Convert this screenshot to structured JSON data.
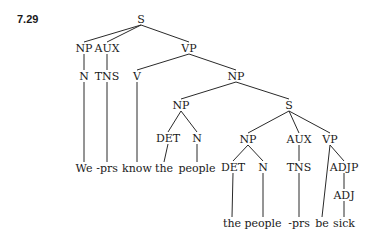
{
  "example_number": "7.29",
  "line_color": "#2a2a2a",
  "nodes": [
    {
      "id": "s0",
      "label": "S",
      "x": 141,
      "y": 19
    },
    {
      "id": "np0",
      "label": "NP",
      "x": 84,
      "y": 48
    },
    {
      "id": "aux0",
      "label": "AUX",
      "x": 107,
      "y": 48
    },
    {
      "id": "vp0",
      "label": "VP",
      "x": 189,
      "y": 48
    },
    {
      "id": "n0",
      "label": "N",
      "x": 84,
      "y": 76
    },
    {
      "id": "tns0",
      "label": "TNS",
      "x": 107,
      "y": 76
    },
    {
      "id": "v0",
      "label": "V",
      "x": 137,
      "y": 76
    },
    {
      "id": "np1",
      "label": "NP",
      "x": 236,
      "y": 76
    },
    {
      "id": "np2",
      "label": "NP",
      "x": 181,
      "y": 105
    },
    {
      "id": "s1",
      "label": "S",
      "x": 289,
      "y": 105
    },
    {
      "id": "det0",
      "label": "DET",
      "x": 168,
      "y": 138
    },
    {
      "id": "n1",
      "label": "N",
      "x": 197,
      "y": 138
    },
    {
      "id": "np3",
      "label": "NP",
      "x": 248,
      "y": 139
    },
    {
      "id": "aux1",
      "label": "AUX",
      "x": 299,
      "y": 139
    },
    {
      "id": "vp1",
      "label": "VP",
      "x": 330,
      "y": 139
    },
    {
      "id": "det1",
      "label": "DET",
      "x": 233,
      "y": 167
    },
    {
      "id": "n2",
      "label": "N",
      "x": 263,
      "y": 167
    },
    {
      "id": "tns1",
      "label": "TNS",
      "x": 299,
      "y": 167
    },
    {
      "id": "adjp0",
      "label": "ADJP",
      "x": 344,
      "y": 167
    },
    {
      "id": "adj0",
      "label": "ADJ",
      "x": 344,
      "y": 195
    },
    {
      "id": "w_we",
      "label": "We",
      "x": 84,
      "y": 168,
      "word": true
    },
    {
      "id": "w_prs1",
      "label": "-prs",
      "x": 107,
      "y": 168,
      "word": true
    },
    {
      "id": "w_know",
      "label": "know",
      "x": 137,
      "y": 168,
      "word": true
    },
    {
      "id": "w_the1",
      "label": "the",
      "x": 164,
      "y": 168,
      "word": true
    },
    {
      "id": "w_people1",
      "label": "people",
      "x": 197,
      "y": 168,
      "word": true
    },
    {
      "id": "w_the2",
      "label": "the",
      "x": 232,
      "y": 223,
      "word": true
    },
    {
      "id": "w_people2",
      "label": "people",
      "x": 263,
      "y": 223,
      "word": true
    },
    {
      "id": "w_prs2",
      "label": "-prs",
      "x": 299,
      "y": 223,
      "word": true
    },
    {
      "id": "w_be",
      "label": "be",
      "x": 322,
      "y": 223,
      "word": true
    },
    {
      "id": "w_sick",
      "label": "sick",
      "x": 344,
      "y": 223,
      "word": true
    }
  ],
  "edges": [
    [
      "s0",
      "np0"
    ],
    [
      "s0",
      "aux0"
    ],
    [
      "s0",
      "vp0"
    ],
    [
      "np0",
      "n0"
    ],
    [
      "aux0",
      "tns0"
    ],
    [
      "vp0",
      "v0"
    ],
    [
      "vp0",
      "np1"
    ],
    [
      "n0",
      "w_we"
    ],
    [
      "tns0",
      "w_prs1"
    ],
    [
      "v0",
      "w_know"
    ],
    [
      "np1",
      "np2"
    ],
    [
      "np1",
      "s1"
    ],
    [
      "np2",
      "det0"
    ],
    [
      "np2",
      "n1"
    ],
    [
      "det0",
      "w_the1"
    ],
    [
      "n1",
      "w_people1"
    ],
    [
      "s1",
      "np3"
    ],
    [
      "s1",
      "aux1"
    ],
    [
      "s1",
      "vp1"
    ],
    [
      "np3",
      "det1"
    ],
    [
      "np3",
      "n2"
    ],
    [
      "aux1",
      "tns1"
    ],
    [
      "vp1",
      "w_be"
    ],
    [
      "vp1",
      "adjp0"
    ],
    [
      "det1",
      "w_the2"
    ],
    [
      "n2",
      "w_people2"
    ],
    [
      "tns1",
      "w_prs2"
    ],
    [
      "adjp0",
      "adj0"
    ],
    [
      "adj0",
      "w_sick"
    ]
  ]
}
